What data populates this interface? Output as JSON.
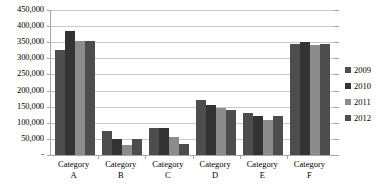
{
  "chart_data": {
    "type": "bar",
    "title": "",
    "xlabel": "",
    "ylabel": "",
    "categories": [
      "Category A",
      "Category B",
      "Category C",
      "Category D",
      "Category E",
      "Category F"
    ],
    "category_lines": [
      [
        "Category",
        "A"
      ],
      [
        "Category",
        "B"
      ],
      [
        "Category",
        "C"
      ],
      [
        "Category",
        "D"
      ],
      [
        "Category",
        "E"
      ],
      [
        "Category",
        "F"
      ]
    ],
    "series": [
      {
        "name": "2009",
        "color": "#4d4d4d",
        "values": [
          325000,
          75000,
          85000,
          170000,
          130000,
          345000
        ]
      },
      {
        "name": "2010",
        "color": "#333333",
        "values": [
          385000,
          50000,
          85000,
          155000,
          120000,
          350000
        ]
      },
      {
        "name": "2011",
        "color": "#8c8c8c",
        "values": [
          355000,
          30000,
          55000,
          145000,
          110000,
          340000
        ]
      },
      {
        "name": "2012",
        "color": "#4d4d4d",
        "values": [
          355000,
          50000,
          35000,
          140000,
          120000,
          345000
        ]
      }
    ],
    "ylim": [
      0,
      450000
    ],
    "ytick_values": [
      0,
      50000,
      100000,
      150000,
      200000,
      250000,
      300000,
      350000,
      400000,
      450000
    ],
    "ytick_labels": [
      "-",
      "50,000",
      "100,000",
      "150,000",
      "200,000",
      "250,000",
      "300,000",
      "350,000",
      "400,000",
      "450,000"
    ],
    "grid": true,
    "legend_position": "right",
    "plot_background": "#ffffff",
    "grid_color": "#c9c9c9",
    "axis_color": "#a6a6a6"
  }
}
